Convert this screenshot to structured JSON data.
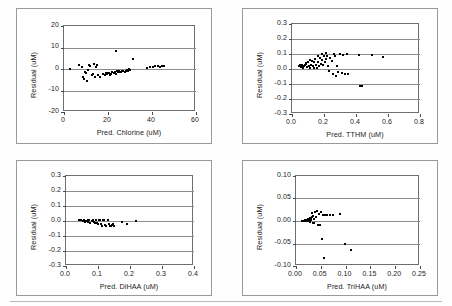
{
  "figure": {
    "panel_count": 4,
    "background": "#ffffff",
    "marker_color": "#000000",
    "gridline_color": "#8d8d8d",
    "axis_color": "#6e6e6e"
  },
  "chart_data": [
    {
      "type": "scatter",
      "title": "",
      "xlabel": "Pred. Chlorine (uM)",
      "ylabel": "Residual (uM)",
      "xlim": [
        0,
        60
      ],
      "ylim": [
        -20,
        20
      ],
      "xticks": [
        "0",
        "20",
        "40",
        "60"
      ],
      "xtick_values": [
        0,
        20,
        40,
        60
      ],
      "yticks": [
        "20",
        "10",
        "0",
        "-10",
        "-20"
      ],
      "ytick_values": [
        20,
        10,
        0,
        -10,
        -20
      ],
      "grid": "horizontal",
      "legend": "none",
      "x": [
        2.5,
        7.0,
        8.0,
        8.5,
        9.0,
        9.5,
        10.0,
        10.5,
        11.0,
        11.5,
        12.0,
        12.5,
        13.0,
        13.5,
        14.0,
        14.5,
        15.0,
        15.5,
        16.5,
        17.5,
        18.5,
        19.0,
        19.5,
        20.0,
        20.5,
        21.0,
        21.5,
        22.0,
        22.5,
        23.0,
        23.5,
        23.5,
        24.0,
        24.5,
        25.0,
        25.5,
        26.0,
        26.5,
        27.0,
        27.5,
        28.0,
        28.5,
        29.0,
        29.5,
        30.0,
        31.5,
        37.5,
        39.0,
        40.5,
        41.5,
        42.5,
        43.5,
        44.5,
        45.5
      ],
      "y": [
        0.0,
        1.8,
        1.0,
        -3.5,
        -4.5,
        -1.5,
        -2.0,
        -5.5,
        -0.5,
        2.0,
        1.5,
        -3.0,
        -2.5,
        2.2,
        -3.5,
        1.0,
        2.0,
        -3.0,
        -3.5,
        -2.5,
        -3.0,
        -2.0,
        -2.5,
        -2.0,
        -1.8,
        -3.0,
        -2.5,
        -1.5,
        -2.0,
        -1.5,
        8.5,
        -2.5,
        -1.0,
        -1.5,
        -1.0,
        -1.5,
        -1.5,
        -0.8,
        -1.0,
        -1.2,
        -1.0,
        -0.5,
        -0.8,
        0.0,
        -0.3,
        4.5,
        0.5,
        1.0,
        0.8,
        1.5,
        1.2,
        0.8,
        1.5,
        1.2
      ]
    },
    {
      "type": "scatter",
      "title": "",
      "xlabel": "Pred. TTHM (uM)",
      "ylabel": "Residual (uM)",
      "xlim": [
        0.0,
        0.8
      ],
      "ylim": [
        -0.3,
        0.3
      ],
      "xticks": [
        "0.0",
        "0.2",
        "0.4",
        "0.6",
        "0.8"
      ],
      "xtick_values": [
        0.0,
        0.2,
        0.4,
        0.6,
        0.8
      ],
      "yticks": [
        "0.3",
        "0.2",
        "0.1",
        "0.0",
        "-0.1",
        "-0.2",
        "-0.3"
      ],
      "ytick_values": [
        0.3,
        0.2,
        0.1,
        0.0,
        -0.1,
        -0.2,
        -0.3
      ],
      "grid": "horizontal",
      "legend": "none",
      "x": [
        0.045,
        0.05,
        0.055,
        0.06,
        0.065,
        0.07,
        0.075,
        0.08,
        0.085,
        0.09,
        0.095,
        0.1,
        0.105,
        0.11,
        0.115,
        0.12,
        0.125,
        0.13,
        0.135,
        0.14,
        0.145,
        0.15,
        0.155,
        0.16,
        0.165,
        0.17,
        0.175,
        0.18,
        0.185,
        0.19,
        0.195,
        0.2,
        0.205,
        0.21,
        0.215,
        0.22,
        0.225,
        0.23,
        0.24,
        0.25,
        0.255,
        0.26,
        0.27,
        0.275,
        0.28,
        0.29,
        0.3,
        0.31,
        0.32,
        0.33,
        0.345,
        0.35,
        0.42,
        0.425,
        0.44,
        0.5,
        0.57
      ],
      "y": [
        0.02,
        0.025,
        0.015,
        0.02,
        0.03,
        0.01,
        0.02,
        0.025,
        0.035,
        0.04,
        0.015,
        0.05,
        0.02,
        0.06,
        0.01,
        0.03,
        0.055,
        0.02,
        0.005,
        0.045,
        0.07,
        0.03,
        0.01,
        0.09,
        0.05,
        0.02,
        0.075,
        0.035,
        0.1,
        0.06,
        0.025,
        0.085,
        0.045,
        0.11,
        0.065,
        0.09,
        0.02,
        -0.01,
        0.075,
        0.055,
        -0.03,
        0.1,
        0.09,
        -0.045,
        0.02,
        -0.02,
        0.1,
        -0.025,
        0.095,
        -0.03,
        0.1,
        -0.03,
        0.095,
        -0.11,
        -0.115,
        0.095,
        0.08
      ]
    },
    {
      "type": "scatter",
      "title": "",
      "xlabel": "Pred. DiHAA (uM)",
      "ylabel": "Residual (uM)",
      "xlim": [
        0.0,
        0.4
      ],
      "ylim": [
        -0.3,
        0.3
      ],
      "xticks": [
        "0.0",
        "0.1",
        "0.2",
        "0.3",
        "0.4"
      ],
      "xtick_values": [
        0.0,
        0.1,
        0.2,
        0.3,
        0.4
      ],
      "yticks": [
        "0.3",
        "0.2",
        "0.1",
        "0.0",
        "-0.1",
        "-0.2",
        "-0.3"
      ],
      "ytick_values": [
        0.3,
        0.2,
        0.1,
        0.0,
        -0.1,
        -0.2,
        -0.3
      ],
      "grid": "horizontal",
      "legend": "none",
      "x": [
        0.042,
        0.048,
        0.052,
        0.056,
        0.06,
        0.064,
        0.068,
        0.07,
        0.073,
        0.076,
        0.08,
        0.083,
        0.086,
        0.09,
        0.093,
        0.096,
        0.1,
        0.103,
        0.106,
        0.11,
        0.113,
        0.116,
        0.12,
        0.123,
        0.126,
        0.13,
        0.133,
        0.136,
        0.14,
        0.143,
        0.146,
        0.15,
        0.175,
        0.19,
        0.22
      ],
      "y": [
        0.005,
        0.008,
        0.002,
        0.005,
        -0.005,
        0.003,
        -0.008,
        0.006,
        0.004,
        -0.01,
        0.002,
        0.007,
        -0.006,
        -0.015,
        0.004,
        -0.012,
        -0.018,
        0.005,
        0.008,
        -0.022,
        -0.03,
        0.006,
        0.009,
        -0.025,
        -0.035,
        0.007,
        -0.02,
        -0.03,
        -0.034,
        -0.028,
        -0.022,
        -0.03,
        -0.008,
        -0.018,
        0.0
      ]
    },
    {
      "type": "scatter",
      "title": "",
      "xlabel": "Pred. TriHAA (uM)",
      "ylabel": "Residual (uM)",
      "xlim": [
        0.0,
        0.25
      ],
      "ylim": [
        -0.1,
        0.1
      ],
      "xticks": [
        "0.00",
        "0.05",
        "0.10",
        "0.15",
        "0.20",
        "0.25"
      ],
      "xtick_values": [
        0.0,
        0.05,
        0.1,
        0.15,
        0.2,
        0.25
      ],
      "yticks": [
        "0.10",
        "0.05",
        "0.00",
        "-0.05",
        "-0.10"
      ],
      "ytick_values": [
        0.1,
        0.05,
        0.0,
        -0.05,
        -0.1
      ],
      "grid": "horizontal",
      "legend": "none",
      "x": [
        0.012,
        0.014,
        0.016,
        0.018,
        0.019,
        0.02,
        0.021,
        0.022,
        0.023,
        0.024,
        0.025,
        0.026,
        0.027,
        0.028,
        0.029,
        0.03,
        0.031,
        0.032,
        0.033,
        0.034,
        0.035,
        0.036,
        0.037,
        0.038,
        0.04,
        0.042,
        0.044,
        0.046,
        0.048,
        0.05,
        0.055,
        0.058,
        0.062,
        0.068,
        0.075,
        0.088,
        0.052,
        0.056,
        0.098,
        0.11
      ],
      "y": [
        0.0,
        0.001,
        0.0,
        0.002,
        0.001,
        -0.001,
        0.003,
        0.002,
        0.0,
        0.004,
        0.003,
        0.001,
        0.005,
        -0.002,
        0.006,
        0.004,
        0.002,
        0.018,
        0.008,
        -0.004,
        0.012,
        0.005,
        -0.005,
        0.02,
        0.01,
        0.022,
        -0.009,
        0.015,
        -0.008,
        0.019,
        0.014,
        0.013,
        0.014,
        0.013,
        0.013,
        0.015,
        -0.04,
        -0.082,
        -0.051,
        -0.064
      ]
    }
  ]
}
